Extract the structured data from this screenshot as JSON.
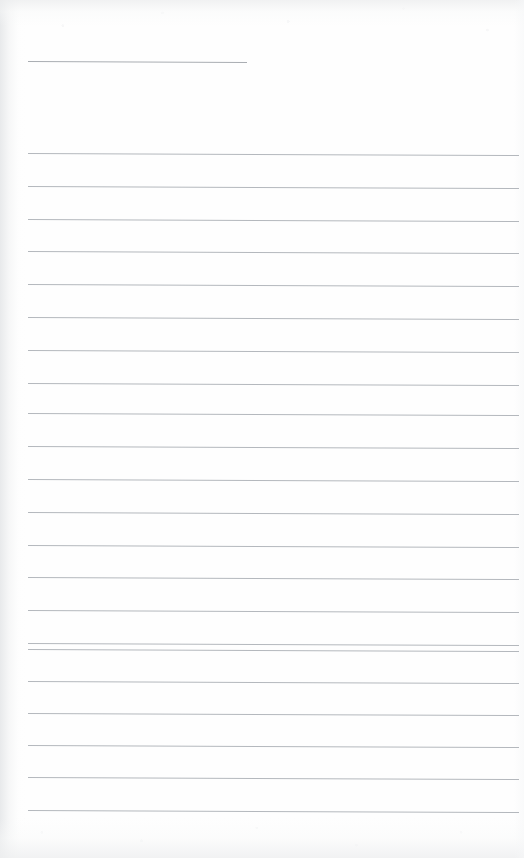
{
  "page": {
    "kind": "scanned-blank-ruled-page",
    "width": 524,
    "height": 858,
    "background_color": "#ffffff",
    "paper_color": "#fefefe",
    "rule_color": "#b4b8bd",
    "text_content": "",
    "notes_written": "",
    "visible_text": []
  },
  "ruling": {
    "line_count_full_width": 21,
    "line_count_short": 1,
    "line_spacing_px": 32.8,
    "left_margin_px": 28,
    "right_edge_px": 519,
    "stroke_width_px": 1,
    "skew_drop_px": 2,
    "short_line": {
      "label": "header-rule",
      "x_start": 28,
      "x_end": 247,
      "y": 61
    },
    "lines": [
      {
        "y": 153
      },
      {
        "y": 186
      },
      {
        "y": 219
      },
      {
        "y": 251
      },
      {
        "y": 284
      },
      {
        "y": 317
      },
      {
        "y": 350
      },
      {
        "y": 383
      },
      {
        "y": 413
      },
      {
        "y": 446
      },
      {
        "y": 479
      },
      {
        "y": 512
      },
      {
        "y": 545
      },
      {
        "y": 577
      },
      {
        "y": 610
      },
      {
        "y": 643
      },
      {
        "y": 649
      },
      {
        "y": 681
      },
      {
        "y": 713
      },
      {
        "y": 745
      },
      {
        "y": 777
      },
      {
        "y": 810
      }
    ]
  }
}
